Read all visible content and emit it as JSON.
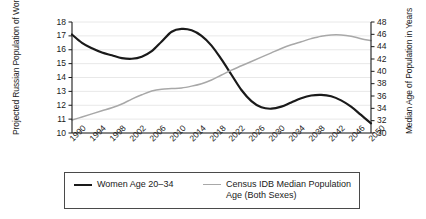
{
  "chart_data": {
    "type": "line",
    "title": "",
    "xlabel": "",
    "ylabel": "Projected Russian Population of Women (millions)",
    "ylabel_right": "Median Age of Population in Years",
    "grid": true,
    "legend_position": "bottom",
    "xlim": [
      1990,
      2050
    ],
    "ylim": [
      10,
      18
    ],
    "ylim_right": [
      30,
      48
    ],
    "xticks": [
      "1990",
      "1994",
      "1998",
      "2002",
      "2006",
      "2010",
      "2014",
      "2018",
      "2022",
      "2026",
      "2030",
      "2034",
      "2038",
      "2042",
      "2046",
      "2050"
    ],
    "yticks_left": [
      "10",
      "11",
      "12",
      "13",
      "14",
      "15",
      "16",
      "17",
      "18"
    ],
    "yticks_right": [
      "30",
      "32",
      "34",
      "36",
      "38",
      "40",
      "42",
      "44",
      "46",
      "48"
    ],
    "x": [
      1990,
      1992,
      1994,
      1996,
      1998,
      2000,
      2002,
      2004,
      2006,
      2008,
      2010,
      2012,
      2014,
      2016,
      2018,
      2020,
      2022,
      2024,
      2026,
      2028,
      2030,
      2032,
      2034,
      2036,
      2038,
      2040,
      2042,
      2044,
      2046,
      2048,
      2050
    ],
    "series": [
      {
        "name": "Women Age 20–34",
        "axis": "left",
        "color": "#1a1a1a",
        "values": [
          17.1,
          16.5,
          16.1,
          15.8,
          15.6,
          15.4,
          15.35,
          15.5,
          15.9,
          16.6,
          17.3,
          17.5,
          17.4,
          17.0,
          16.3,
          15.3,
          14.2,
          13.1,
          12.3,
          11.85,
          11.75,
          11.9,
          12.2,
          12.5,
          12.7,
          12.75,
          12.65,
          12.35,
          11.9,
          11.3,
          10.7
        ]
      },
      {
        "name": "Census IDB Median Population Age (Both Sexes)",
        "axis": "right",
        "color": "#a8a8a8",
        "values": [
          32.1,
          32.6,
          33.1,
          33.6,
          34.1,
          34.7,
          35.5,
          36.2,
          36.8,
          37.1,
          37.2,
          37.3,
          37.6,
          38.0,
          38.6,
          39.4,
          40.2,
          40.9,
          41.6,
          42.3,
          43.0,
          43.7,
          44.3,
          44.8,
          45.3,
          45.7,
          45.9,
          45.9,
          45.7,
          45.3,
          45.0
        ]
      }
    ]
  },
  "legend": {
    "items": [
      {
        "label": "Women Age 20–34",
        "color": "#1a1a1a"
      },
      {
        "label": "Census IDB Median Population",
        "label2": "Age (Both Sexes)",
        "color": "#a8a8a8"
      }
    ]
  }
}
